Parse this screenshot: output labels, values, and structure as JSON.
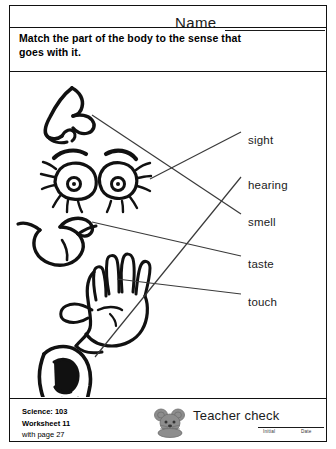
{
  "header": {
    "name_label": "Name"
  },
  "instructions": "Match the part of the body to the sense that goes with it.",
  "senses": [
    {
      "label": "sight",
      "x": 238,
      "y": 62
    },
    {
      "label": "hearing",
      "x": 238,
      "y": 107
    },
    {
      "label": "smell",
      "x": 238,
      "y": 144
    },
    {
      "label": "taste",
      "x": 238,
      "y": 186
    },
    {
      "label": "touch",
      "x": 238,
      "y": 224
    }
  ],
  "body_parts": [
    {
      "name": "nose",
      "matches": "smell"
    },
    {
      "name": "eyes",
      "matches": "sight"
    },
    {
      "name": "tongue",
      "matches": "taste"
    },
    {
      "name": "hand",
      "matches": "touch"
    },
    {
      "name": "ear",
      "matches": "hearing"
    }
  ],
  "match_lines": [
    {
      "from": "nose",
      "to": "smell",
      "x1": 82,
      "y1": 43,
      "x2": 231,
      "y2": 142
    },
    {
      "from": "eyes",
      "to": "sight",
      "x1": 140,
      "y1": 107,
      "x2": 231,
      "y2": 60
    },
    {
      "from": "tongue",
      "to": "taste",
      "x1": 82,
      "y1": 150,
      "x2": 231,
      "y2": 184
    },
    {
      "from": "hand",
      "to": "touch",
      "x1": 107,
      "y1": 207,
      "x2": 231,
      "y2": 222
    },
    {
      "from": "ear",
      "to": "hearing",
      "x1": 85,
      "y1": 285,
      "x2": 231,
      "y2": 105
    }
  ],
  "footer": {
    "subject_line": "Science: 103",
    "worksheet_line": "Worksheet 11",
    "page_line": "with page 27",
    "teacher_check_label": "Teacher check",
    "initial_label": "Initial",
    "date_label": "Date"
  },
  "colors": {
    "ink": "#1b1b1b",
    "line": "#3a3a3a",
    "mascot": "#8d8d8d"
  }
}
